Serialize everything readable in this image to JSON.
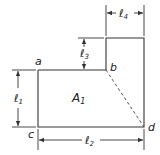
{
  "diagram": {
    "points": {
      "a": "a",
      "b": "b",
      "c": "c",
      "d": "d"
    },
    "area_label": {
      "base": "A",
      "sub": "1"
    },
    "dimensions": {
      "l1": {
        "base": "ℓ",
        "sub": "1"
      },
      "l2": {
        "base": "ℓ",
        "sub": "2"
      },
      "l3": {
        "base": "ℓ",
        "sub": "3"
      },
      "l4": {
        "base": "ℓ",
        "sub": "4"
      }
    },
    "colors": {
      "line": "#333333",
      "dashed": "#555555",
      "background": "#ffffff"
    }
  }
}
